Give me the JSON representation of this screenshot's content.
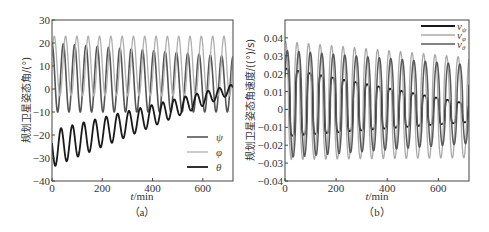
{
  "chart_data": [
    {
      "id": "a",
      "type": "line",
      "caption": "（a）",
      "title": "",
      "xlabel": "t/min",
      "ylabel": "规划卫星姿态角/(°)",
      "xlim": [
        0,
        720
      ],
      "ylim": [
        -40,
        30
      ],
      "xticks": [
        0,
        200,
        400,
        600
      ],
      "yticks": [
        -40,
        -30,
        -20,
        -10,
        0,
        10,
        20,
        30
      ],
      "grid": false,
      "legend_position": "lower right",
      "period_min": 45,
      "series": [
        {
          "name": "ψ",
          "color": "#555555",
          "width": 1.6,
          "offset_start": 5,
          "offset_end": 2,
          "amp_start": 15,
          "amp_end": 12,
          "phase": 0.25,
          "description": "oscillates ~-11 to 20, amplitude slowly decreasing"
        },
        {
          "name": "φ",
          "color": "#b0b0b0",
          "width": 1.3,
          "offset_start": 10,
          "offset_end": 10,
          "amp_start": 13,
          "amp_end": 13,
          "phase": 0.05,
          "description": "oscillates ~-3 to 23, constant amplitude"
        },
        {
          "name": "θ",
          "color": "#1a1a1a",
          "width": 1.8,
          "offset_start": -26,
          "offset_end": 0,
          "amp_start": 8,
          "amp_end": 2,
          "phase": 0.45,
          "description": "rising trend from ~-26 to ~0, amplitude decaying"
        }
      ]
    },
    {
      "id": "b",
      "type": "line",
      "caption": "（b）",
      "title": "",
      "xlabel": "t/min",
      "ylabel": "规划卫星姿态角速度/((°)/s)",
      "xlim": [
        0,
        720
      ],
      "ylim": [
        -0.04,
        0.05
      ],
      "xticks": [
        0,
        200,
        400,
        600
      ],
      "yticks": [
        -0.04,
        -0.03,
        -0.02,
        -0.01,
        0,
        0.01,
        0.02,
        0.03,
        0.04
      ],
      "ytick_labels": [
        "−0.04",
        "−0.03",
        "−0.02",
        "−0.01",
        "0",
        "0.01",
        "0.02",
        "0.03",
        "0.04"
      ],
      "grid": false,
      "legend_position": "upper right",
      "period_min": 45,
      "series": [
        {
          "name": "vψ",
          "label_main": "v",
          "label_sub": "ψ",
          "color": "#1a1a1a",
          "width": 1.8,
          "offset_start": 0.004,
          "offset_end": -0.002,
          "amp_start": 0.019,
          "amp_end": 0.005,
          "phase": 0.1,
          "description": "peaks ~0.023 decaying toward ~0, troughs ~-0.015 rising to ~-0.005"
        },
        {
          "name": "vφ",
          "label_main": "v",
          "label_sub": "φ",
          "color": "#aaaaaa",
          "width": 1.3,
          "offset_start": 0.005,
          "offset_end": 0.001,
          "amp_start": 0.033,
          "amp_end": 0.028,
          "phase": 0.2,
          "description": "sharp peaks ~0.04 decreasing to ~0.03, troughs ~-0.029"
        },
        {
          "name": "vθ",
          "label_main": "v",
          "label_sub": "θ",
          "color": "#5a5a5a",
          "width": 1.5,
          "offset_start": 0.003,
          "offset_end": 0.003,
          "amp_start": 0.03,
          "amp_end": 0.022,
          "phase": 0.05,
          "description": "oscillates ~-0.027 to 0.035 decreasing amplitude"
        }
      ]
    }
  ],
  "figure": {
    "panel_a": {
      "caption": "（a）",
      "xlabel_italic": "t",
      "xlabel_rest": "/min",
      "ylabel": "规划卫星姿态角/(°)"
    },
    "panel_b": {
      "caption": "（b）",
      "xlabel_italic": "t",
      "xlabel_rest": "/min",
      "ylabel": "规划卫星姿态角速度/((°)/s)"
    }
  }
}
